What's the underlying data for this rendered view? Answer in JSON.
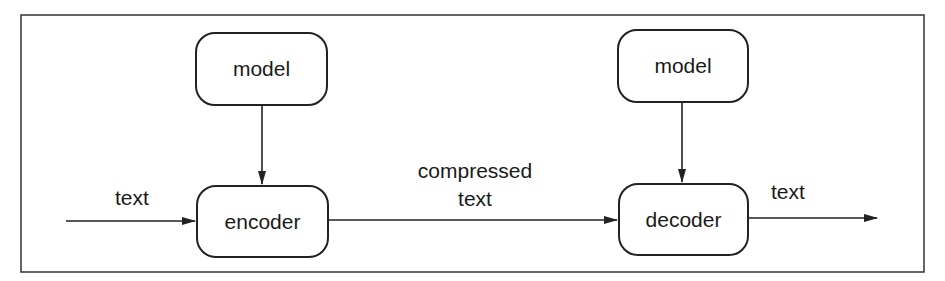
{
  "diagram": {
    "title": "",
    "nodes": {
      "model_left": "model",
      "encoder": "encoder",
      "model_right": "model",
      "decoder": "decoder"
    },
    "edge_labels": {
      "input": "text",
      "compressed_line1": "compressed",
      "compressed_line2": "text",
      "output": "text"
    },
    "edges": [
      {
        "from": "input",
        "to": "encoder",
        "label": "text"
      },
      {
        "from": "model_left",
        "to": "encoder",
        "label": ""
      },
      {
        "from": "encoder",
        "to": "decoder",
        "label": "compressed text"
      },
      {
        "from": "model_right",
        "to": "decoder",
        "label": ""
      },
      {
        "from": "decoder",
        "to": "output",
        "label": "text"
      }
    ],
    "colors": {
      "stroke": "#222222",
      "background": "#ffffff"
    }
  }
}
